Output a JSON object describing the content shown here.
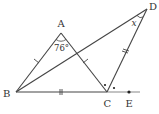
{
  "diagram": {
    "type": "geometry",
    "points": {
      "A": {
        "label": "A",
        "x": 61,
        "y": 33
      },
      "B": {
        "label": "B",
        "x": 16,
        "y": 92
      },
      "C": {
        "label": "C",
        "x": 107,
        "y": 92
      },
      "D": {
        "label": "D",
        "x": 147,
        "y": 9
      },
      "E": {
        "label": "E",
        "x": 129,
        "y": 92
      }
    },
    "segments": [
      "AB",
      "AC",
      "BC",
      "BD",
      "CD",
      "CE"
    ],
    "angle_A": "76°",
    "angle_x": "x",
    "equal_marks": {
      "single_tick": [
        "AB",
        "AC"
      ],
      "double_tick": [
        "BC",
        "CD"
      ]
    },
    "equal_angle_dots": [
      "angle ACD",
      "angle DCE"
    ]
  }
}
